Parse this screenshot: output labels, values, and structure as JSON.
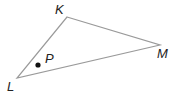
{
  "figure": {
    "type": "triangle",
    "vertices": [
      {
        "name": "K",
        "x": 67,
        "y": 17
      },
      {
        "name": "M",
        "x": 160,
        "y": 45
      },
      {
        "name": "L",
        "x": 17,
        "y": 78
      }
    ],
    "point": {
      "name": "P",
      "x": 38,
      "y": 65
    },
    "labels": {
      "K": "K",
      "M": "M",
      "L": "L",
      "P": "P"
    },
    "stroke_color": "#9a9a9a",
    "point_color": "#111111"
  }
}
